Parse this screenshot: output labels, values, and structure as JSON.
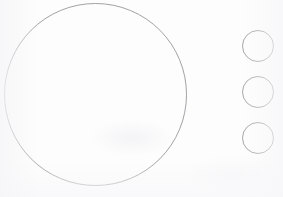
{
  "canvas": {
    "width": 283,
    "height": 197,
    "background_color": "#fdfdfd",
    "title": "Circles line drawing"
  },
  "style": {
    "stroke_color": "#8a8a90",
    "stroke_color_small": "#8f8f95",
    "stroke_width": 0.8,
    "fill": "none"
  },
  "shapes": {
    "large_circle": {
      "name": "large-circle",
      "cx": 95.5,
      "cy": 94.5,
      "r": 91,
      "diameter": 182,
      "stroke": "#8a8a90",
      "stroke_width": 0.8,
      "fill": "none"
    },
    "small_circles": [
      {
        "name": "small-circle-1",
        "index": 1,
        "cx": 258,
        "cy": 46,
        "r": 15.5,
        "diameter": 31,
        "stroke": "#8f8f95",
        "stroke_width": 0.8,
        "fill": "none"
      },
      {
        "name": "small-circle-2",
        "index": 2,
        "cx": 258,
        "cy": 92,
        "r": 15.5,
        "diameter": 31,
        "stroke": "#8f8f95",
        "stroke_width": 0.8,
        "fill": "none"
      },
      {
        "name": "small-circle-3",
        "index": 3,
        "cx": 258,
        "cy": 138,
        "r": 15.5,
        "diameter": 31,
        "stroke": "#8f8f95",
        "stroke_width": 0.8,
        "fill": "none"
      }
    ]
  }
}
